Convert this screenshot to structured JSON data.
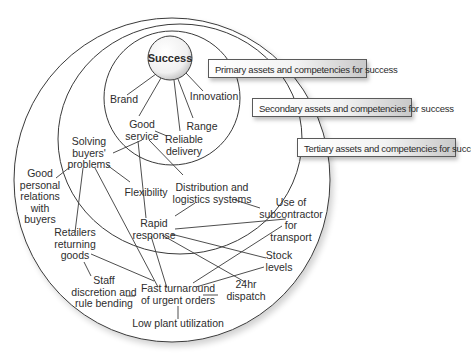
{
  "diagram": {
    "center": "Success",
    "tiers": [
      {
        "id": "primary",
        "label": "Primary assets and competencies for success"
      },
      {
        "id": "secondary",
        "label": "Secondary assets and competencies for success"
      },
      {
        "id": "tertiary",
        "label": "Tertiary assets and competencies for success"
      }
    ],
    "nodes": {
      "brand": "Brand",
      "innovation": "Innovation",
      "good_service": "Good\nservice",
      "range": "Range",
      "reliable_delivery": "Reliable\ndelivery",
      "solving_buyers_problems": "Solving\nbuyers'\nproblems",
      "good_personal_relations": "Good\npersonal\nrelations\nwith\nbuyers",
      "flexibility": "Flexibility",
      "distribution_logistics": "Distribution and\nlogistics systems",
      "rapid_response": "Rapid\nresponse",
      "use_of_subcontractor": "Use of\nsubcontractor\nfor\ntransport",
      "retailers_returning_goods": "Retailers\nreturning\ngoods",
      "stock_levels": "Stock\nlevels",
      "staff_discretion": "Staff\ndiscretion and\nrule bending",
      "fast_turnaround": "Fast turnaround\nof urgent orders",
      "dispatch_24hr": "24hr\ndispatch",
      "low_plant_utilization": "Low plant utilization"
    },
    "edges": [
      [
        "success",
        "brand"
      ],
      [
        "success",
        "good_service"
      ],
      [
        "success",
        "reliable_delivery"
      ],
      [
        "success",
        "range"
      ],
      [
        "success",
        "innovation"
      ],
      [
        "good_service",
        "reliable_delivery"
      ],
      [
        "good_service",
        "solving_buyers_problems"
      ],
      [
        "good_service",
        "rapid_response"
      ],
      [
        "good_service",
        "distribution_logistics"
      ],
      [
        "solving_buyers_problems",
        "good_personal_relations"
      ],
      [
        "solving_buyers_problems",
        "retailers_returning_goods"
      ],
      [
        "solving_buyers_problems",
        "flexibility"
      ],
      [
        "solving_buyers_problems",
        "fast_turnaround"
      ],
      [
        "distribution_logistics",
        "rapid_response"
      ],
      [
        "distribution_logistics",
        "use_of_subcontractor"
      ],
      [
        "rapid_response",
        "use_of_subcontractor"
      ],
      [
        "rapid_response",
        "stock_levels"
      ],
      [
        "rapid_response",
        "dispatch_24hr"
      ],
      [
        "rapid_response",
        "fast_turnaround"
      ],
      [
        "retailers_returning_goods",
        "staff_discretion"
      ],
      [
        "retailers_returning_goods",
        "fast_turnaround"
      ],
      [
        "staff_discretion",
        "fast_turnaround"
      ],
      [
        "fast_turnaround",
        "use_of_subcontractor"
      ],
      [
        "fast_turnaround",
        "stock_levels"
      ],
      [
        "fast_turnaround",
        "dispatch_24hr"
      ],
      [
        "fast_turnaround",
        "low_plant_utilization"
      ]
    ]
  }
}
